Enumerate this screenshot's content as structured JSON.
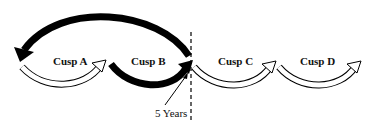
{
  "diagram": {
    "type": "cusp-timeline",
    "cusps": [
      {
        "id": "A",
        "label": "Cusp A",
        "arrow_style": "outline"
      },
      {
        "id": "B",
        "label": "Cusp B",
        "arrow_style": "solid"
      },
      {
        "id": "C",
        "label": "Cusp C",
        "arrow_style": "outline"
      },
      {
        "id": "D",
        "label": "Cusp D",
        "arrow_style": "outline"
      }
    ],
    "return_arrow": {
      "from": "end of Cusp B",
      "to": "start of Cusp A",
      "style": "solid"
    },
    "marker": {
      "label": "5 Years",
      "style": "dashed-vertical-line"
    },
    "colors": {
      "solid": "#000000",
      "outline": "#000000",
      "fill_outline": "#ffffff",
      "background": "#ffffff"
    }
  }
}
